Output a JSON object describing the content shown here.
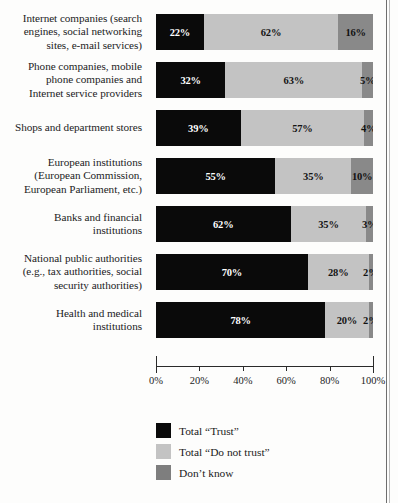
{
  "chart_data": {
    "type": "bar",
    "orientation": "horizontal",
    "stacked": true,
    "title": "",
    "xlabel": "",
    "ylabel": "",
    "xlim": [
      0,
      100
    ],
    "grid": false,
    "legend_position": "bottom-left",
    "xticks": [
      "0%",
      "20%",
      "40%",
      "60%",
      "80%",
      "100%"
    ],
    "xtick_values": [
      0,
      20,
      40,
      60,
      80,
      100
    ],
    "categories": [
      "Internet companies (search engines, social networking sites, e-mail services)",
      "Phone companies, mobile phone companies and Internet service providers",
      "Shops and department stores",
      "European institutions (European Commission, European Parliament, etc.)",
      "Banks and financial institutions",
      "National public authorities (e.g., tax authorities, social security authorities)",
      "Health and medical institutions"
    ],
    "category_lines": [
      [
        "Internet companies (search",
        "engines, social networking",
        "sites, e-mail services)"
      ],
      [
        "Phone companies, mobile",
        "phone companies and",
        "Internet service providers"
      ],
      [
        "Shops and department stores"
      ],
      [
        "European institutions",
        "(European Commission,",
        "European Parliament, etc.)"
      ],
      [
        "Banks and financial",
        "institutions"
      ],
      [
        "National public authorities",
        "(e.g., tax authorities, social",
        "security authorities)"
      ],
      [
        "Health and medical",
        "institutions"
      ]
    ],
    "series": [
      {
        "name": "Total “Trust”",
        "color": "#0a0a0a",
        "values": [
          22,
          32,
          39,
          55,
          62,
          70,
          78
        ],
        "labels": [
          "22%",
          "32%",
          "39%",
          "55%",
          "62%",
          "70%",
          "78%"
        ]
      },
      {
        "name": "Total “Do not trust”",
        "color": "#c3c3c3",
        "values": [
          62,
          63,
          57,
          35,
          35,
          28,
          20
        ],
        "labels": [
          "62%",
          "63%",
          "57%",
          "35%",
          "35%",
          "28%",
          "20%"
        ]
      },
      {
        "name": "Don’t know",
        "color": "#898989",
        "values": [
          16,
          5,
          4,
          10,
          3,
          2,
          2
        ],
        "labels": [
          "16%",
          "5%",
          "4%",
          "10%",
          "3%",
          "2%",
          "2%"
        ]
      }
    ]
  },
  "legend": {
    "items": [
      {
        "label": "Total “Trust”",
        "swatch": "trust-swatch",
        "color": "#0a0a0a"
      },
      {
        "label": "Total “Do not trust”",
        "swatch": "distrust-swatch",
        "color": "#c3c3c3"
      },
      {
        "label": "Don’t know",
        "swatch": "dontknow-swatch",
        "color": "#7e7e7e"
      }
    ]
  }
}
